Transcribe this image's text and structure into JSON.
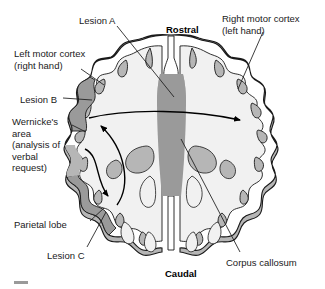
{
  "figure": {
    "background_color": "#ffffff"
  },
  "labels": {
    "lesion_a": "Lesion A",
    "left_motor_cortex": "Left motor cortex\n(right hand)",
    "lesion_b": "Lesion B",
    "wernickes_area": "Wernicke's\narea\n(analysis of\nverbal\nrequest)",
    "parietal_lobe": "Parietal lobe",
    "lesion_c": "Lesion C",
    "rostral": "Rostral",
    "right_motor_cortex": "Right motor cortex\n(left hand)",
    "corpus_callosum": "Corpus callosum",
    "caudal": "Caudal"
  },
  "colors": {
    "outline": "#1a1a1a",
    "gray_matter": "#b6b6b6",
    "white_matter": "#f1f1f1",
    "lesion": "#9a9a9a",
    "corpus_callosum": "#9a9a9a",
    "text": "#1a1a1a",
    "background": "#ffffff"
  },
  "annotations": {
    "leader_lines": [
      "Lesion A to midline corpus callosum region",
      "Left motor cortex to left anterior cortex",
      "Lesion B to left lateral cortex",
      "Wernicke's area to left posterior-lateral cortex",
      "Parietal lobe to left posterior cortex",
      "Lesion C to left posterior cortex",
      "Right motor cortex to right anterior cortex",
      "Corpus callosum to midline band"
    ],
    "arrows": [
      "Long horizontal arrow from left lateral cortex across midline to right motor cortex",
      "Curved arrow from left parietal region up to left motor cortex",
      "Curved arrow from Wernicke's area down to left parietal lobe"
    ]
  }
}
